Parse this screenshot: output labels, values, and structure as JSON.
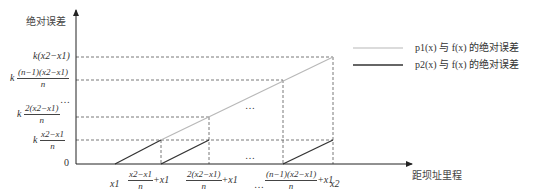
{
  "axes": {
    "y_title": "绝对误差",
    "x_title": "距坝址里程",
    "origin_label": "0"
  },
  "y_ticks": [
    {
      "prefix": "k",
      "expr": "(x2−x1)",
      "type": "inline"
    },
    {
      "prefix": "k",
      "num": "(n−1)(x2−x1)",
      "den": "n",
      "type": "frac"
    },
    {
      "ellipsis": "…"
    },
    {
      "prefix": "k",
      "num": "2(x2−x1)",
      "den": "n",
      "type": "frac"
    },
    {
      "prefix": "k",
      "num": "x2−x1",
      "den": "n",
      "type": "frac"
    }
  ],
  "x_ticks": [
    {
      "label": "x1"
    },
    {
      "num": "x2−x1",
      "den": "n",
      "suffix": "+x1"
    },
    {
      "num": "2(x2−x1)",
      "den": "n",
      "suffix": "+x1"
    },
    {
      "ellipsis": "…"
    },
    {
      "num": "(n−1)(x2−x1)",
      "den": "n",
      "suffix": "+x1"
    },
    {
      "label": "x2"
    }
  ],
  "legend": [
    {
      "label": "p1(x) 与 f(x) 的绝对误差",
      "color": "#b8b8b8"
    },
    {
      "label": "p2(x) 与 f(x) 的绝对误差",
      "color": "#333333"
    }
  ],
  "annotations": {
    "ellipsis_upper": "…",
    "ellipsis_lower": "…"
  },
  "colors": {
    "axis": "#222222",
    "dashed": "#555555",
    "p1_line": "#b8b8b8",
    "p2_line": "#333333"
  }
}
